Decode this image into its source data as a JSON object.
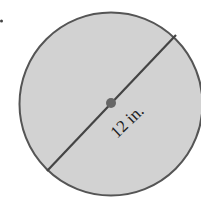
{
  "figure": {
    "shape": "circle",
    "diameter_label": "12 in.",
    "colors": {
      "fill": "#d2d2d2",
      "stroke": "#555555",
      "center_dot": "#666666",
      "text": "#222222"
    }
  }
}
